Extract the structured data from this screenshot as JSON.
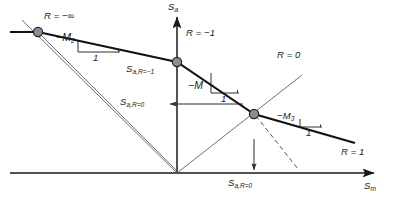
{
  "figure": {
    "type": "haigh-constant-life-diagram",
    "title": "",
    "axes": {
      "x_label": "S_m",
      "x_label_text": "S",
      "x_label_sub": "m",
      "y_label_text": "S",
      "y_label_sub": "a",
      "origin_px": [
        177,
        173
      ],
      "x_axis_end_px": [
        378,
        173
      ],
      "y_axis_end_px": [
        177,
        13
      ],
      "grid": false
    },
    "labels": {
      "r_neg_inf": {
        "text": "R = −∞",
        "x": 44,
        "y": 12
      },
      "r_neg_one": {
        "text": "R = −1",
        "x": 186,
        "y": 29
      },
      "r_zero": {
        "text": "R = 0",
        "x": 277,
        "y": 51
      },
      "r_one": {
        "text": "R = 1",
        "x": 341,
        "y": 148
      },
      "sa_r_neg1": {
        "text": "S",
        "sub": "a,R=−1",
        "x": 126,
        "y": 65
      },
      "sa_r0_mid": {
        "text": "S",
        "sub": "a,R=0",
        "x": 120,
        "y": 107
      },
      "sa_r0_bottom": {
        "text": "S",
        "sub": "a,R=0",
        "x": 228,
        "y": 179
      },
      "slope_m2": {
        "text": "−M",
        "sub": "2",
        "x": 56,
        "y": 33
      },
      "slope_m2_run": {
        "text": "1",
        "x": 81,
        "y": 47
      },
      "slope_m": {
        "text": "−M",
        "x": 190,
        "y": 81
      },
      "slope_m_run": {
        "text": "1",
        "x": 207,
        "y": 96
      },
      "slope_m3": {
        "text": "−M",
        "sub": "3",
        "x": 277,
        "y": 112
      },
      "slope_m3_run": {
        "text": "1",
        "x": 296,
        "y": 124
      },
      "x_axis_name": {
        "text": "S",
        "sub": "m",
        "x": 364,
        "y": 182
      },
      "y_axis_name": {
        "text": "S",
        "sub": "a",
        "x": 168,
        "y": 2
      }
    },
    "nodes": [
      {
        "name": "node-r-neg-inf",
        "x": 38,
        "y": 32,
        "r": 4.6
      },
      {
        "name": "node-r-neg-one",
        "x": 177,
        "y": 62,
        "r": 4.6
      },
      {
        "name": "node-r-zero",
        "x": 254,
        "y": 114,
        "r": 4.6
      }
    ],
    "life_line": {
      "description": "piecewise-linear constant-life envelope",
      "points_px": [
        [
          10,
          32
        ],
        [
          38,
          32
        ],
        [
          177,
          62
        ],
        [
          254,
          114
        ],
        [
          355,
          143
        ]
      ],
      "segment_slopes": [
        "0",
        "-M2",
        "-M",
        "-M3"
      ]
    },
    "r_rays": [
      {
        "name": "ray-r-neg-inf",
        "from": [
          177,
          173
        ],
        "to": [
          22,
          20
        ]
      },
      {
        "name": "ray-r-neg-one",
        "from": [
          177,
          173
        ],
        "to": [
          177,
          13
        ]
      },
      {
        "name": "ray-r-zero",
        "from": [
          177,
          173
        ],
        "to": [
          300,
          77
        ]
      },
      {
        "name": "ray-r-neg-inf-secondary",
        "from": [
          38,
          32
        ],
        "to": [
          178,
          172
        ]
      }
    ],
    "dashed_line": {
      "from": [
        254,
        114
      ],
      "to": [
        297,
        168
      ]
    },
    "dimension_arrows": [
      {
        "name": "sa-r0-horizontal-arrow",
        "from": [
          240,
          104
        ],
        "to": [
          168,
          104
        ],
        "direction": "left"
      },
      {
        "name": "sa-r0-vertical-arrow",
        "from": [
          254,
          141
        ],
        "to": [
          254,
          171
        ],
        "direction": "down"
      }
    ],
    "colors": {
      "ink": "#1a1a1a",
      "thin": "#55555a",
      "node_fill": "#8c8c92",
      "node_stroke": "#2b2b2b",
      "background": "#ffffff"
    }
  }
}
